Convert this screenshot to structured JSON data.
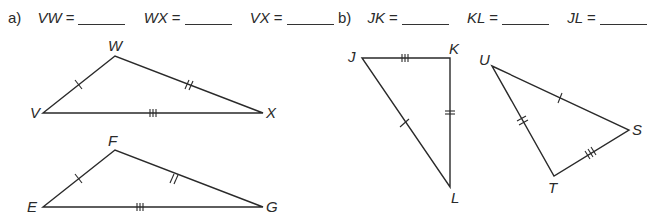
{
  "part_a": {
    "label": "a)",
    "items": [
      {
        "segment": "VW",
        "eq": "=",
        "answer": ""
      },
      {
        "segment": "WX",
        "eq": "=",
        "answer": ""
      },
      {
        "segment": "VX",
        "eq": "=",
        "answer": ""
      }
    ],
    "triangles": [
      {
        "name": "VWX",
        "vertices": {
          "V": "V",
          "W": "W",
          "X": "X"
        },
        "marks": {
          "VW": 1,
          "WX": 2,
          "VX": 3
        }
      },
      {
        "name": "EFG",
        "vertices": {
          "E": "E",
          "F": "F",
          "G": "G"
        },
        "marks": {
          "EF": 1,
          "FG": 2,
          "EG": 3
        }
      }
    ]
  },
  "part_b": {
    "label": "b)",
    "items": [
      {
        "segment": "JK",
        "eq": "=",
        "answer": ""
      },
      {
        "segment": "KL",
        "eq": "=",
        "answer": ""
      },
      {
        "segment": "JL",
        "eq": "=",
        "answer": ""
      }
    ],
    "triangles": [
      {
        "name": "JKL",
        "vertices": {
          "J": "J",
          "K": "K",
          "L": "L"
        },
        "marks": {
          "JK": 3,
          "KL": 2,
          "JL": 1
        }
      },
      {
        "name": "UST",
        "vertices": {
          "U": "U",
          "S": "S",
          "T": "T"
        },
        "marks": {
          "US": 1,
          "UT": 2,
          "TS": 3
        }
      }
    ]
  }
}
